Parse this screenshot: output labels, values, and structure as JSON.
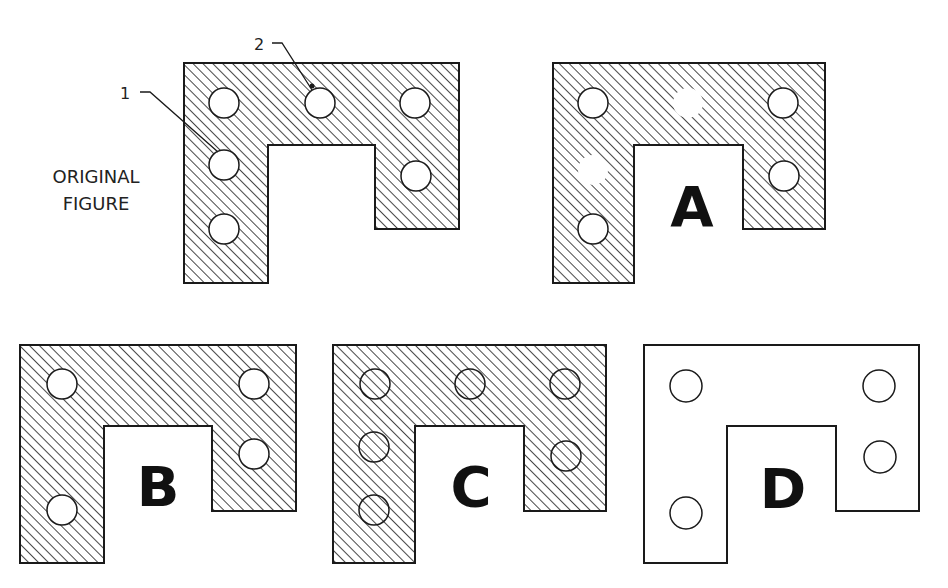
{
  "diagram": {
    "caption_original": [
      "ORIGINAL",
      "FIGURE"
    ],
    "callouts": [
      {
        "label": "1"
      },
      {
        "label": "2"
      }
    ],
    "options": [
      {
        "letter": "A",
        "style": "hatched",
        "description": "holes 1 and 2 shown blank without outline"
      },
      {
        "letter": "B",
        "style": "hatched",
        "description": "four holes, holes 1 and 2 removed"
      },
      {
        "letter": "C",
        "style": "hatched",
        "description": "six holes drawn as outlines with hatch passing through"
      },
      {
        "letter": "D",
        "style": "unhatched",
        "description": "four hole outlines, no hatching"
      }
    ]
  },
  "colors": {
    "ink": "#1a1a1a",
    "paper": "#ffffff"
  }
}
